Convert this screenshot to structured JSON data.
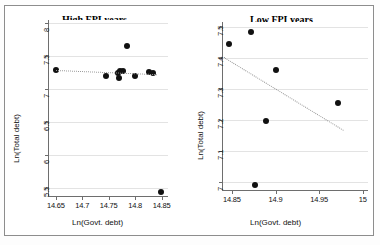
{
  "figure": {
    "background": "#ffffff",
    "frame_color": "#8d8d8d",
    "marker_color": "#111111",
    "trend_color": "#9a9a9a",
    "grid_color": "#e3e3e3"
  },
  "chart_data": [
    {
      "type": "scatter",
      "title": "High FPI years",
      "xlabel": "Ln(Govt. debt)",
      "ylabel": "Ln(Total debt)",
      "xlim": [
        14.635,
        14.862
      ],
      "ylim": [
        5.38,
        8.05
      ],
      "xticks": [
        14.65,
        14.7,
        14.75,
        14.8,
        14.85
      ],
      "xtick_labels": [
        "14.65",
        "14.7",
        "14.75",
        "14.8",
        "14.85"
      ],
      "yticks": [
        5.5,
        6,
        6.5,
        7,
        7.5,
        8
      ],
      "ytick_labels": [
        "5.5",
        "6",
        "6.5",
        "7",
        "7.5",
        "8"
      ],
      "grid": true,
      "legend": "none",
      "points": [
        {
          "x": 14.6505,
          "y": 7.289
        },
        {
          "x": 14.7455,
          "y": 7.198
        },
        {
          "x": 14.7675,
          "y": 7.253
        },
        {
          "x": 14.7705,
          "y": 7.281
        },
        {
          "x": 14.7695,
          "y": 7.173
        },
        {
          "x": 14.7765,
          "y": 7.283
        },
        {
          "x": 14.7845,
          "y": 7.662
        },
        {
          "x": 14.8005,
          "y": 7.205
        },
        {
          "x": 14.8265,
          "y": 7.258
        },
        {
          "x": 14.8345,
          "y": 7.241
        },
        {
          "x": 14.8495,
          "y": 5.441
        }
      ],
      "trendline": {
        "x_start": 14.6495,
        "y_start": 7.295,
        "x_end": 14.8395,
        "y_end": 7.232,
        "style": "dotted"
      }
    },
    {
      "type": "scatter",
      "title": "Low FPI years",
      "xlabel": "Ln(Govt. debt)",
      "ylabel": "Ln(Total debt)",
      "xlim": [
        14.8385,
        15.006
      ],
      "ylim": [
        6.975,
        7.517
      ],
      "xticks": [
        14.85,
        14.9,
        14.95,
        15
      ],
      "xtick_labels": [
        "14.85",
        "14.9",
        "14.95",
        "15"
      ],
      "yticks": [
        7,
        7.1,
        7.2,
        7.3,
        7.4,
        7.5
      ],
      "ytick_labels": [
        "7",
        "7.1",
        "7.2",
        "7.3",
        "7.4",
        "7.5"
      ],
      "grid": true,
      "legend": "none",
      "points": [
        {
          "x": 14.8465,
          "y": 7.446
        },
        {
          "x": 14.8715,
          "y": 7.484
        },
        {
          "x": 14.8765,
          "y": 6.991
        },
        {
          "x": 14.8885,
          "y": 7.197
        },
        {
          "x": 14.9005,
          "y": 7.361
        },
        {
          "x": 14.9715,
          "y": 7.256
        }
      ],
      "trendline": {
        "x_start": 14.8405,
        "y_start": 7.403,
        "x_end": 14.9775,
        "y_end": 7.168,
        "style": "dotted"
      }
    }
  ]
}
